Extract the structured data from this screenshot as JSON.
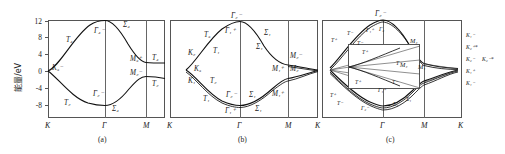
{
  "figure": {
    "y_axis": {
      "title": "能量/eV",
      "ticks": [
        "12",
        "8",
        "4",
        "0",
        "-4",
        "-8"
      ],
      "min": -10,
      "max": 12
    },
    "x_path": [
      "K",
      "Γ",
      "M",
      "K"
    ]
  },
  "panels": [
    {
      "caption": "(a)",
      "x_ticks": [
        "K",
        "Γ",
        "M"
      ],
      "labels": [
        "K₃⁻",
        "T₄",
        "Γ₄⁻",
        "Σ₄",
        "M₃⁺",
        "T₄",
        "M₂⁻",
        "T₂",
        "Γ₂⁻",
        "T₂",
        "Σ₄"
      ]
    },
    {
      "caption": "(b)",
      "x_ticks": [
        "K",
        "Γ",
        "M",
        "K"
      ],
      "labels": [
        "Γ₂⁻",
        "Γ₁⁺",
        "Σ₁",
        "Σ₁",
        "T₃",
        "T₁",
        "K₂",
        "K₃",
        "K₁",
        "T₂",
        "T₁",
        "Γ₂⁻",
        "Γ₁⁺",
        "Σ₁",
        "Σ₁",
        "M₂⁻",
        "M₁⁺",
        "M₂⁻",
        "M₁⁺"
      ]
    },
    {
      "caption": "(c)",
      "x_ticks": [
        "Γ",
        "M",
        "K"
      ],
      "labels": [
        "Γ₂⁻",
        "Γ₁⁺",
        "Γ₂",
        "T⁻",
        "T⁺",
        "T⁻",
        "M₄",
        "M₄",
        "M₁",
        "T⁺",
        "T⁻",
        "Γ₂⁻",
        "Γ₁⁺",
        "Σ₄",
        "Σ₁",
        "K₁⁻",
        "K₂⁺*",
        "K₂⁻",
        "K₂⁻*",
        "K₁⁺",
        "K₁⁻"
      ],
      "inset_labels": [
        "T⁺",
        "T⁻",
        "T⁺",
        "T⁻"
      ]
    }
  ],
  "colors": {
    "axis": "#555555",
    "band": "#111111"
  }
}
